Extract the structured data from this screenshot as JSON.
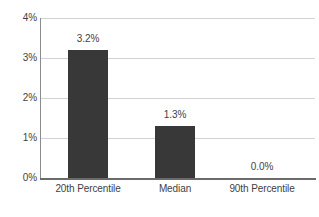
{
  "chart_data": {
    "type": "bar",
    "title": "",
    "subtitle": "",
    "xlabel": "",
    "ylabel": "",
    "categories": [
      "20th Percentile",
      "Median",
      "90th Percentile"
    ],
    "values": [
      3.2,
      1.3,
      0.0
    ],
    "data_labels": [
      "3.2%",
      "1.3%",
      "0.0%"
    ],
    "ylim": [
      0,
      4
    ],
    "ytick_labels": [
      "0%",
      "1%",
      "2%",
      "3%",
      "4%"
    ],
    "ytick_values": [
      0,
      1,
      2,
      3,
      4
    ],
    "grid": true,
    "grid_axis": "y",
    "legend": false,
    "legend_position": "none",
    "series": [
      {
        "name": "",
        "values": [
          3.2,
          1.3,
          0.0
        ]
      }
    ],
    "colors": {
      "bar": "#383838",
      "gridline": "#d2d2d2",
      "axis": "#6b6b6b",
      "y_axis": "#8c8c8c",
      "text": "#3f3f3f",
      "background": "#ffffff"
    }
  }
}
